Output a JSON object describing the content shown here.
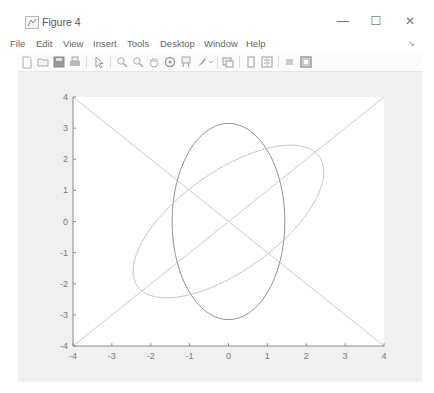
{
  "window": {
    "title": "Figure 4",
    "controls": {
      "minimize": "—",
      "maximize": "☐",
      "close": "✕"
    }
  },
  "menu": {
    "items": [
      "File",
      "Edit",
      "View",
      "Insert",
      "Tools",
      "Desktop",
      "Window",
      "Help"
    ],
    "overflow_icon": "↘"
  },
  "toolbar": {
    "icons": [
      "new-figure-icon",
      "open-file-icon",
      "save-icon",
      "print-icon",
      "edit-plot-arrow-icon",
      "zoom-in-icon",
      "zoom-out-icon",
      "pan-hand-icon",
      "rotate-3d-icon",
      "data-cursor-icon",
      "brush-icon",
      "brush-dropdown-icon",
      "link-plot-icon",
      "insert-colorbar-icon",
      "insert-legend-icon",
      "hide-plot-tools-icon",
      "show-plot-tools-icon"
    ]
  },
  "colors": {
    "figure_bg": "#f0f0f0",
    "axes_bg": "#ffffff",
    "axis_color": "#8c8c8c",
    "diagonal_lines": "#c9c9c9",
    "vertical_ellipse": "#8f8f8f",
    "tilted_ellipse": "#c4c4c4"
  },
  "chart_data": {
    "type": "line",
    "title": "",
    "xlabel": "",
    "ylabel": "",
    "xlim": [
      -4,
      4
    ],
    "ylim": [
      -4,
      4
    ],
    "xticks": [
      -4,
      -3,
      -2,
      -1,
      0,
      1,
      2,
      3,
      4
    ],
    "yticks": [
      -4,
      -3,
      -2,
      -1,
      0,
      1,
      2,
      3,
      4
    ],
    "xtick_labels": [
      "-4",
      "-3",
      "-2",
      "-1",
      "0",
      "1",
      "2",
      "3",
      "4"
    ],
    "ytick_labels": [
      "-4",
      "-3",
      "-2",
      "-1",
      "0",
      "1",
      "2",
      "3",
      "4"
    ],
    "grid": false,
    "legend": null,
    "series": [
      {
        "name": "line y = x",
        "kind": "line",
        "x": [
          -4,
          4
        ],
        "y": [
          -4,
          4
        ]
      },
      {
        "name": "line y = -x",
        "kind": "line",
        "x": [
          -4,
          4
        ],
        "y": [
          4,
          -4
        ]
      },
      {
        "name": "vertical ellipse",
        "kind": "ellipse",
        "center": [
          0,
          0
        ],
        "semi_axis_x": 1.45,
        "semi_axis_y": 3.15,
        "rotation_deg": 0
      },
      {
        "name": "rotated ellipse",
        "kind": "ellipse",
        "center": [
          0,
          0
        ],
        "semi_axis_x": 1.45,
        "semi_axis_y": 3.15,
        "rotation_deg": -45
      }
    ]
  }
}
